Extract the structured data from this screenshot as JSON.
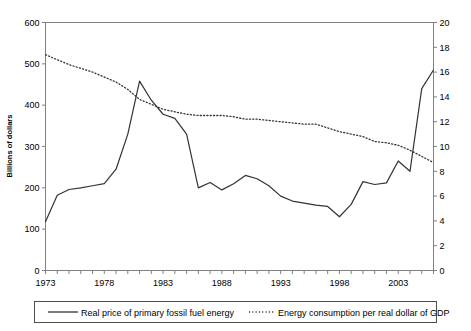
{
  "chart_data": {
    "type": "line",
    "title": "",
    "xlabel": "",
    "ylabel": "Billions of dollars",
    "y2label": "",
    "xlim": [
      1973,
      2006
    ],
    "ylim": [
      0,
      600
    ],
    "y2lim": [
      0,
      20
    ],
    "grid": false,
    "legend_position": "bottom",
    "x_tick_labels": [
      "1973",
      "1978",
      "1983",
      "1988",
      "1993",
      "1998",
      "2003"
    ],
    "x_tick_values": [
      1973,
      1978,
      1983,
      1988,
      1993,
      1998,
      2003
    ],
    "y_tick_labels": [
      "0",
      "100",
      "200",
      "300",
      "400",
      "500",
      "600"
    ],
    "y_tick_values": [
      0,
      100,
      200,
      300,
      400,
      500,
      600
    ],
    "y2_tick_labels": [
      "0",
      "2",
      "4",
      "6",
      "8",
      "10",
      "12",
      "14",
      "16",
      "18",
      "20"
    ],
    "y2_tick_values": [
      0,
      2,
      4,
      6,
      8,
      10,
      12,
      14,
      16,
      18,
      20
    ],
    "x": [
      1973,
      1974,
      1975,
      1976,
      1977,
      1978,
      1979,
      1980,
      1981,
      1982,
      1983,
      1984,
      1985,
      1986,
      1987,
      1988,
      1989,
      1990,
      1991,
      1992,
      1993,
      1994,
      1995,
      1996,
      1997,
      1998,
      1999,
      2000,
      2001,
      2002,
      2003,
      2004,
      2005,
      2006
    ],
    "series": [
      {
        "name": "Real price of primary fossil fuel energy",
        "axis": "left",
        "style": "solid",
        "color": "#333333",
        "values": [
          118,
          182,
          196,
          200,
          205,
          210,
          245,
          330,
          458,
          412,
          378,
          368,
          330,
          200,
          213,
          195,
          210,
          230,
          222,
          205,
          180,
          168,
          163,
          158,
          155,
          130,
          160,
          215,
          208,
          212,
          265,
          240,
          440,
          485
        ]
      },
      {
        "name": "Energy consumption per real dollar of GDP",
        "axis": "right",
        "style": "dotted",
        "color": "#333333",
        "values": [
          17.4,
          17.0,
          16.6,
          16.3,
          16.0,
          15.6,
          15.2,
          14.6,
          13.8,
          13.4,
          13.0,
          12.8,
          12.6,
          12.5,
          12.5,
          12.5,
          12.4,
          12.2,
          12.2,
          12.1,
          12.0,
          11.9,
          11.8,
          11.8,
          11.5,
          11.2,
          11.0,
          10.8,
          10.4,
          10.3,
          10.1,
          9.7,
          9.2,
          8.7
        ]
      }
    ],
    "legend": [
      {
        "label": "Real price of primary fossil fuel energy",
        "style": "solid"
      },
      {
        "label": "Energy consumption per real dollar of GDP",
        "style": "dotted"
      }
    ]
  }
}
